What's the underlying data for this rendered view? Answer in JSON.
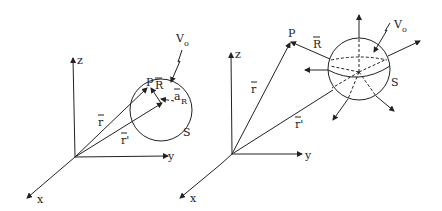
{
  "figure": {
    "left_panel": {
      "axes": {
        "z": "z",
        "y": "y",
        "x": "x"
      },
      "labels": {
        "source_potential": "V",
        "source_potential_sub": "o",
        "field_point": "P",
        "distance_vector": "R",
        "unit_vector": "a",
        "unit_vector_sub": "R",
        "position_vector": "r",
        "source_position_vector": "r'",
        "surface": "S"
      }
    },
    "right_panel": {
      "axes": {
        "z": "z",
        "y": "y",
        "x": "x"
      },
      "labels": {
        "source_potential": "V",
        "source_potential_sub": "o",
        "field_point": "P",
        "distance_vector": "R",
        "position_vector": "r",
        "source_position_vector": "r'",
        "surface": "S"
      }
    }
  }
}
